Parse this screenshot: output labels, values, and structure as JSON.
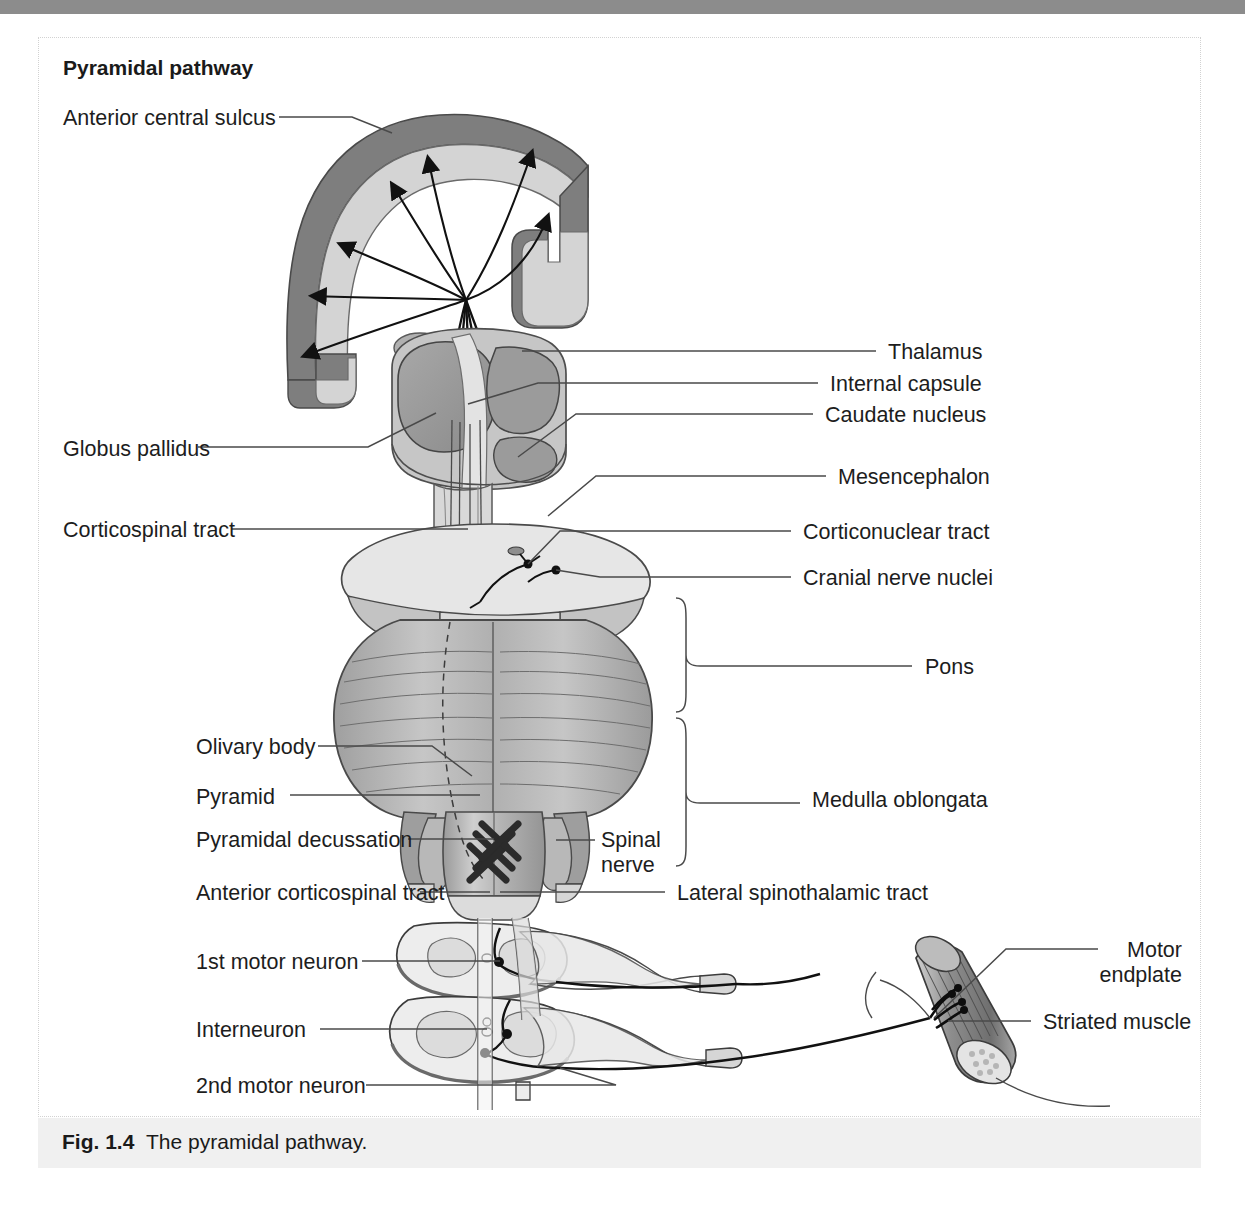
{
  "figure": {
    "title": "Pyramidal pathway",
    "caption_prefix": "Fig. 1.4",
    "caption_text": "The pyramidal pathway.",
    "caption_full": "Fig. 1.4  The pyramidal pathway."
  },
  "colors": {
    "page_background": "#ffffff",
    "top_band": "#8c8c8c",
    "caption_band": "#f0f0f0",
    "border": "#d2d2d2",
    "text": "#1d1d1d",
    "leader_line": "#4a4a4a",
    "cortex_outer": "#808080",
    "cortex_inner": "#d2d2d2",
    "basal_ganglia_dark": "#8f8f8f",
    "basal_ganglia_mid": "#b4b4b4",
    "basal_ganglia_light": "#d8d8d8",
    "mesencephalon": "#e2e2e2",
    "pons": "#b9b9b9",
    "medulla": "#c8c8c8",
    "cord": "#ebebeb",
    "muscle": "#9a9a9a",
    "fiber": "#111111"
  },
  "labels_left": [
    {
      "id": "anterior-central-sulcus",
      "text": "Anterior central sulcus",
      "x": 63,
      "y": 106
    },
    {
      "id": "globus-pallidus",
      "text": "Globus pallidus",
      "x": 63,
      "y": 437
    },
    {
      "id": "corticospinal-tract",
      "text": "Corticospinal tract",
      "x": 63,
      "y": 518
    },
    {
      "id": "olivary-body",
      "text": "Olivary body",
      "x": 196,
      "y": 735
    },
    {
      "id": "pyramid",
      "text": "Pyramid",
      "x": 196,
      "y": 785
    },
    {
      "id": "pyramidal-decussation",
      "text": "Pyramidal decussation",
      "x": 196,
      "y": 828
    },
    {
      "id": "anterior-corticospinal-tract",
      "text": "Anterior corticospinal tract",
      "x": 196,
      "y": 881
    },
    {
      "id": "first-motor-neuron",
      "text": "1st motor neuron",
      "x": 196,
      "y": 950
    },
    {
      "id": "interneuron",
      "text": "Interneuron",
      "x": 196,
      "y": 1018
    },
    {
      "id": "second-motor-neuron",
      "text": "2nd motor neuron",
      "x": 196,
      "y": 1074
    }
  ],
  "labels_right": [
    {
      "id": "thalamus",
      "text": "Thalamus",
      "x": 888,
      "y": 340
    },
    {
      "id": "internal-capsule",
      "text": "Internal capsule",
      "x": 830,
      "y": 372
    },
    {
      "id": "caudate-nucleus",
      "text": "Caudate nucleus",
      "x": 825,
      "y": 403
    },
    {
      "id": "mesencephalon",
      "text": "Mesencephalon",
      "x": 838,
      "y": 465
    },
    {
      "id": "corticonuclear-tract",
      "text": "Corticonuclear tract",
      "x": 803,
      "y": 520
    },
    {
      "id": "cranial-nerve-nuclei",
      "text": "Cranial nerve nuclei",
      "x": 803,
      "y": 566
    },
    {
      "id": "pons",
      "text": "Pons",
      "x": 925,
      "y": 655
    },
    {
      "id": "medulla-oblongata",
      "text": "Medulla oblongata",
      "x": 812,
      "y": 788
    },
    {
      "id": "lateral-spinothalamic-tract",
      "text": "Lateral spinothalamic tract",
      "x": 677,
      "y": 881
    },
    {
      "id": "striated-muscle",
      "text": "Striated muscle",
      "x": 1043,
      "y": 1010
    }
  ],
  "labels_inline": [
    {
      "id": "spinal-nerve",
      "line1": "Spinal",
      "line2": "nerve",
      "x": 601,
      "y": 828
    },
    {
      "id": "motor-endplate",
      "line1": "Motor",
      "line2": "endplate",
      "x": 1110,
      "y": 938,
      "align": "right"
    }
  ]
}
